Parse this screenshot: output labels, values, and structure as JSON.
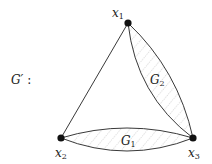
{
  "graph": {
    "name": "G'",
    "name_suffix": ":",
    "nodes": [
      {
        "id": "x1",
        "base": "x",
        "sub": "1"
      },
      {
        "id": "x2",
        "base": "x",
        "sub": "2"
      },
      {
        "id": "x3",
        "base": "x",
        "sub": "3"
      }
    ],
    "edges": [
      {
        "from": "x1",
        "to": "x2",
        "type": "straight"
      },
      {
        "from": "x1",
        "to": "x3",
        "type": "lens",
        "label_base": "G",
        "label_sub": "2",
        "hatched": true
      },
      {
        "from": "x2",
        "to": "x3",
        "type": "lens",
        "label_base": "G",
        "label_sub": "1",
        "hatched": true
      }
    ]
  },
  "labels": {
    "graph_name": "G′",
    "graph_colon": ":",
    "x1_base": "x",
    "x1_sub": "1",
    "x2_base": "x",
    "x2_sub": "2",
    "x3_base": "x",
    "x3_sub": "3",
    "g1_base": "G",
    "g1_sub": "1",
    "g2_base": "G",
    "g2_sub": "2"
  },
  "colors": {
    "stroke": "#222222",
    "hatch": "#9a9a9a",
    "node": "#111111"
  }
}
